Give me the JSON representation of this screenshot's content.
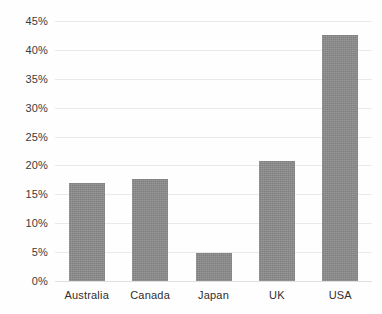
{
  "chart_data": {
    "type": "bar",
    "title": "",
    "xlabel": "",
    "ylabel": "",
    "categories": [
      "Australia",
      "Canada",
      "Japan",
      "UK",
      "USA"
    ],
    "values": [
      17.0,
      17.6,
      4.8,
      20.8,
      42.5
    ],
    "ylim": [
      0,
      45
    ],
    "ytick_labels": [
      "0%",
      "5%",
      "10%",
      "15%",
      "20%",
      "25%",
      "30%",
      "35%",
      "40%",
      "45%"
    ],
    "ytick_values": [
      0,
      5,
      10,
      15,
      20,
      25,
      30,
      35,
      40,
      45
    ],
    "value_format": "percent",
    "grid": true,
    "grid_axis": "y",
    "legend": false,
    "legend_position": "none",
    "series": [
      {
        "name": "",
        "color": "#8b8b8b",
        "values": [
          17.0,
          17.6,
          4.8,
          20.8,
          42.5
        ]
      }
    ],
    "colors": {
      "bar_fill": "#8b8b8b",
      "gridline": "#e9eaec",
      "baseline": "#dfe0e2",
      "tick_text": "#3b3b3b",
      "background": "#fefefe"
    }
  }
}
